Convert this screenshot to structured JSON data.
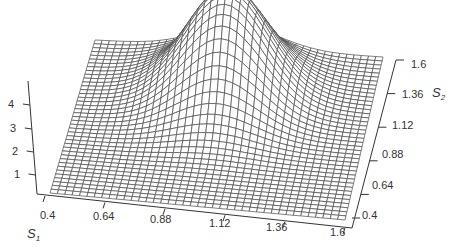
{
  "chart_data": {
    "type": "surface-wireframe",
    "title": "",
    "x_axis": {
      "label": "S",
      "subscript": "1",
      "ticks": [
        "0.4",
        "0.64",
        "0.88",
        "1.12",
        "1.36",
        "1.6"
      ],
      "range": [
        0.4,
        1.6
      ]
    },
    "y_axis": {
      "label": "S",
      "subscript": "2",
      "ticks": [
        "0.4",
        "0.64",
        "0.88",
        "1.12",
        "1.36",
        "1.6"
      ],
      "range": [
        0.4,
        1.6
      ]
    },
    "z_axis": {
      "label": "",
      "ticks": [
        "1",
        "2",
        "3",
        "4"
      ],
      "range": [
        0,
        4.6
      ]
    },
    "surface": {
      "description": "Single smooth Gaussian-like peak (max ≈ 4.6) over a flat near-zero plane",
      "peak_location": {
        "s1": 1.0,
        "s2": 1.25
      },
      "peak_height": 4.6,
      "spread": {
        "s1": 0.17,
        "s2": 0.2
      },
      "baseline": 0.0,
      "grid_lines_per_axis": 41
    },
    "grid": true,
    "legend": null
  },
  "colors": {
    "mesh": "#4a4a4a",
    "axis": "#333333",
    "background": "#ffffff"
  }
}
